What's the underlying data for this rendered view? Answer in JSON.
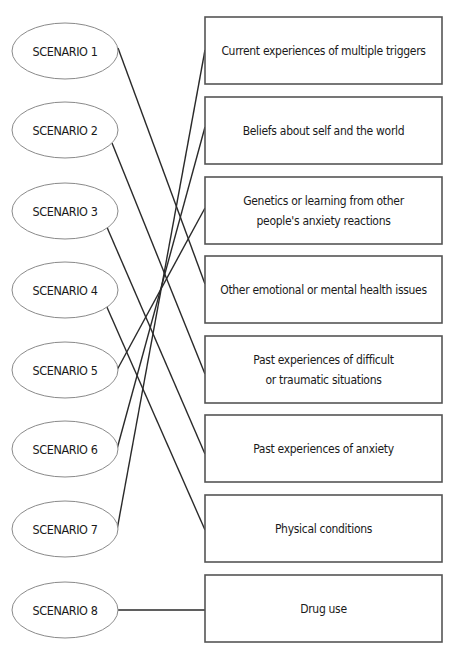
{
  "diagram": {
    "type": "matching-exercise",
    "scenarios": [
      {
        "label": "SCENARIO 1",
        "cy": 51
      },
      {
        "label": "SCENARIO 2",
        "cy": 130
      },
      {
        "label": "SCENARIO 3",
        "cy": 211
      },
      {
        "label": "SCENARIO 4",
        "cy": 290
      },
      {
        "label": "SCENARIO 5",
        "cy": 370
      },
      {
        "label": "SCENARIO 6",
        "cy": 449
      },
      {
        "label": "SCENARIO 7",
        "cy": 529
      },
      {
        "label": "SCENARIO 8",
        "cy": 610
      }
    ],
    "causes": [
      {
        "lines": [
          "Current experiences of multiple triggers"
        ],
        "y": 17
      },
      {
        "lines": [
          "Beliefs about self and the world"
        ],
        "y": 97
      },
      {
        "lines": [
          "Genetics or learning from other",
          "people's anxiety reactions"
        ],
        "y": 177
      },
      {
        "lines": [
          "Other emotional or mental health issues"
        ],
        "y": 256
      },
      {
        "lines": [
          "Past experiences of difficult",
          "or traumatic situations"
        ],
        "y": 336
      },
      {
        "lines": [
          "Past experiences of anxiety"
        ],
        "y": 415
      },
      {
        "lines": [
          "Physical conditions"
        ],
        "y": 495
      },
      {
        "lines": [
          "Drug use"
        ],
        "y": 575
      }
    ],
    "connections": [
      {
        "scenario": 1,
        "cause": 4,
        "from": [
          118,
          48
        ],
        "to": [
          205,
          284
        ]
      },
      {
        "scenario": 2,
        "cause": 5,
        "from": [
          112,
          143
        ],
        "to": [
          205,
          374
        ]
      },
      {
        "scenario": 3,
        "cause": 6,
        "from": [
          106,
          225
        ],
        "to": [
          205,
          454
        ]
      },
      {
        "scenario": 4,
        "cause": 7,
        "from": [
          106,
          305
        ],
        "to": [
          205,
          530
        ]
      },
      {
        "scenario": 5,
        "cause": 3,
        "from": [
          117,
          370
        ],
        "to": [
          205,
          208
        ]
      },
      {
        "scenario": 6,
        "cause": 2,
        "from": [
          117,
          449
        ],
        "to": [
          205,
          127
        ]
      },
      {
        "scenario": 7,
        "cause": 1,
        "from": [
          117,
          530
        ],
        "to": [
          205,
          50
        ]
      },
      {
        "scenario": 8,
        "cause": 8,
        "from": [
          118,
          610
        ],
        "to": [
          205,
          610
        ]
      }
    ],
    "geometry": {
      "ellipse": {
        "cx": 65,
        "rx": 53,
        "ry": 28
      },
      "box": {
        "x": 205,
        "width": 237,
        "height": 67
      }
    },
    "colors": {
      "ellipse_stroke": "#8a8a8a",
      "box_stroke": "#555555",
      "line": "#2a2a2a",
      "text": "#1a1a1a"
    }
  }
}
